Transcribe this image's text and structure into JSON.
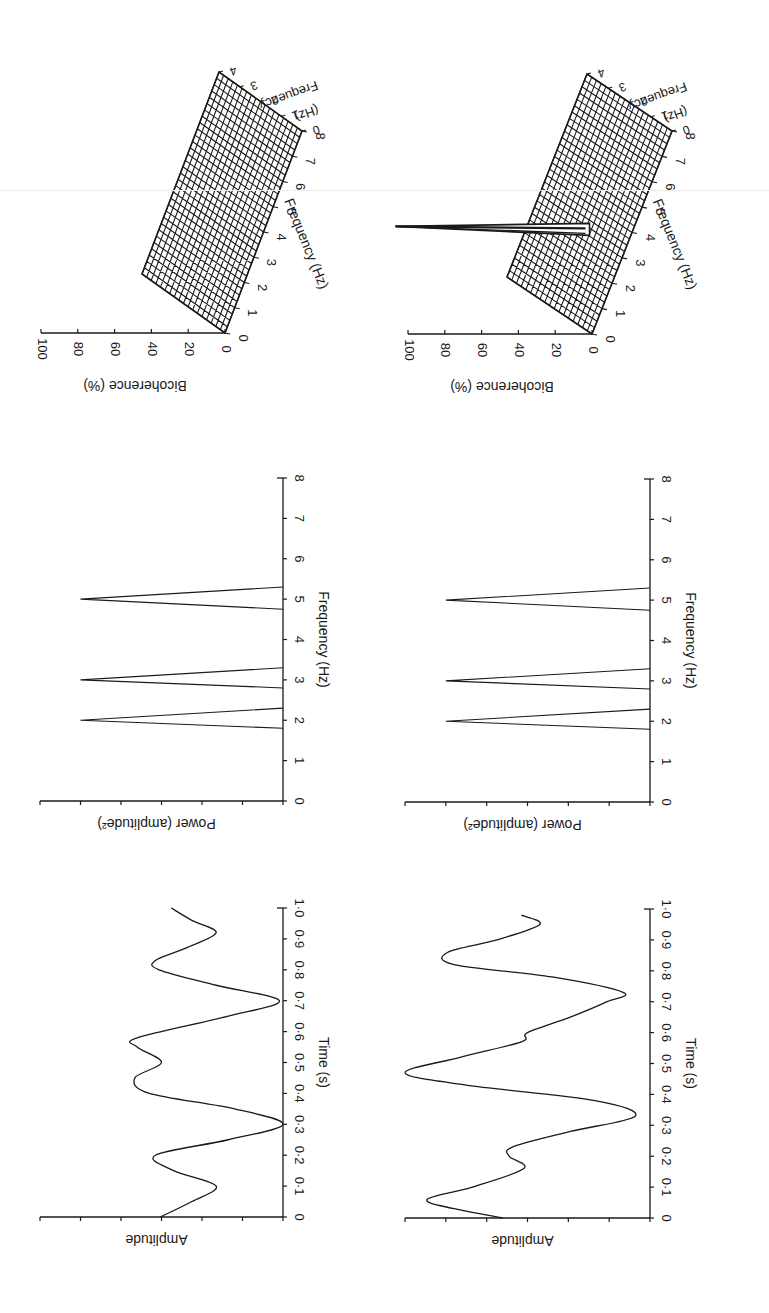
{
  "figure": {
    "orientation": "rotated 90 degrees clockwise",
    "colors": {
      "ink": "#1a1a1a",
      "background": "#ffffff"
    }
  },
  "chart_data": [
    {
      "id": "time-series-a",
      "type": "line",
      "title": "",
      "xlabel": "Time (s)",
      "ylabel": "Amplitude",
      "x_ticks": [
        "0",
        "0·1",
        "0·2",
        "0·3",
        "0·4",
        "0·5",
        "0·6",
        "0·7",
        "0·8",
        "0·9",
        "1·0"
      ],
      "xlim": [
        0,
        1.0
      ],
      "ylim": [
        -1,
        1
      ],
      "y_tick_count": 7,
      "x": [
        0,
        0.05,
        0.1,
        0.15,
        0.2,
        0.25,
        0.3,
        0.35,
        0.4,
        0.45,
        0.5,
        0.55,
        0.58,
        0.65,
        0.7,
        0.75,
        0.8,
        0.83,
        0.87,
        0.92,
        0.96,
        1.0
      ],
      "values": [
        0.01,
        -0.25,
        -0.45,
        -0.1,
        0.05,
        -0.55,
        -1.0,
        -0.6,
        0.1,
        0.22,
        0.0,
        0.2,
        0.2,
        -0.55,
        -0.97,
        -0.45,
        0.02,
        0.05,
        -0.2,
        -0.45,
        -0.25,
        -0.08
      ],
      "grid": false
    },
    {
      "id": "time-series-b",
      "type": "line",
      "title": "",
      "xlabel": "Time (s)",
      "ylabel": "Amplitude",
      "x_ticks": [
        "0",
        "0·1",
        "0·2",
        "0·3",
        "0·4",
        "0·5",
        "0·6",
        "0·7",
        "0·8",
        "0·9",
        "1·0"
      ],
      "xlim": [
        0,
        1.0
      ],
      "ylim": [
        -1,
        1
      ],
      "y_tick_count": 7,
      "x": [
        0,
        0.03,
        0.06,
        0.1,
        0.16,
        0.2,
        0.23,
        0.28,
        0.33,
        0.38,
        0.43,
        0.47,
        0.52,
        0.57,
        0.6,
        0.65,
        0.7,
        0.73,
        0.78,
        0.82,
        0.86,
        0.9,
        0.95,
        0.98
      ],
      "values": [
        0.2,
        0.6,
        0.82,
        0.45,
        0.03,
        0.15,
        0.12,
        -0.35,
        -0.88,
        -0.55,
        0.5,
        1.0,
        0.55,
        0.05,
        0.0,
        -0.35,
        -0.65,
        -0.78,
        -0.2,
        0.6,
        0.65,
        0.25,
        -0.1,
        0.05
      ],
      "grid": false
    },
    {
      "id": "power-spectrum-a",
      "type": "line",
      "title": "",
      "xlabel": "Frequency (Hz)",
      "ylabel": "Power (amplitude²)",
      "x_ticks": [
        "0",
        "1",
        "2",
        "3",
        "4",
        "5",
        "6",
        "7",
        "8"
      ],
      "xlim": [
        0,
        8
      ],
      "ylim": [
        0,
        1.2
      ],
      "y_tick_count": 7,
      "peaks": [
        {
          "frequency": 2,
          "base_low": 1.8,
          "base_high": 2.3,
          "power": 1.0
        },
        {
          "frequency": 3,
          "base_low": 2.8,
          "base_high": 3.3,
          "power": 1.0
        },
        {
          "frequency": 5,
          "base_low": 4.75,
          "base_high": 5.3,
          "power": 1.0
        }
      ],
      "grid": false
    },
    {
      "id": "power-spectrum-b",
      "type": "line",
      "title": "",
      "xlabel": "Frequency (Hz)",
      "ylabel": "Power (amplitude²)",
      "x_ticks": [
        "0",
        "1",
        "2",
        "3",
        "4",
        "5",
        "6",
        "7",
        "8"
      ],
      "xlim": [
        0,
        8
      ],
      "ylim": [
        0,
        1.2
      ],
      "y_tick_count": 7,
      "peaks": [
        {
          "frequency": 2,
          "base_low": 1.8,
          "base_high": 2.3,
          "power": 1.0
        },
        {
          "frequency": 3,
          "base_low": 2.8,
          "base_high": 3.3,
          "power": 1.0
        },
        {
          "frequency": 5,
          "base_low": 4.75,
          "base_high": 5.3,
          "power": 1.0
        }
      ],
      "grid": false
    },
    {
      "id": "bicoherence-a",
      "type": "surface",
      "title": "",
      "zlabel": "Bicoherence (%)",
      "xlabel": "Frequency (Hz)",
      "ylabel": "Frequency (Hz)",
      "z_ticks": [
        "0",
        "20",
        "40",
        "60",
        "80",
        "100"
      ],
      "x_ticks": [
        "0",
        "1",
        "2",
        "3",
        "4",
        "5",
        "6",
        "7",
        "8"
      ],
      "y_ticks": [
        "0",
        "1",
        "2",
        "3",
        "4"
      ],
      "zlim": [
        0,
        100
      ],
      "xlim": [
        0,
        8
      ],
      "ylim": [
        0,
        4
      ],
      "surface_level": 0,
      "spikes": []
    },
    {
      "id": "bicoherence-b",
      "type": "surface",
      "title": "",
      "zlabel": "Bicoherence (%)",
      "xlabel": "Frequency (Hz)",
      "ylabel": "Frequency (Hz)",
      "z_ticks": [
        "0",
        "20",
        "40",
        "60",
        "80",
        "100"
      ],
      "x_ticks": [
        "0",
        "1",
        "2",
        "3",
        "4",
        "5",
        "6",
        "7",
        "8"
      ],
      "y_ticks": [
        "0",
        "1",
        "2",
        "3",
        "4"
      ],
      "zlim": [
        0,
        100
      ],
      "xlim": [
        0,
        8
      ],
      "ylim": [
        0,
        4
      ],
      "surface_level": 0,
      "spikes": [
        {
          "f1": 3,
          "f2": 2,
          "value": 100
        }
      ]
    }
  ],
  "labels": {
    "amplitude": "Amplitude",
    "time": "Time (s)",
    "power": "Power (amplitude²)",
    "frequency": "Frequency (Hz)",
    "bicoherence": "Bicoherence (%)",
    "freq_word": "Frequency",
    "hz": "(Hz)"
  }
}
